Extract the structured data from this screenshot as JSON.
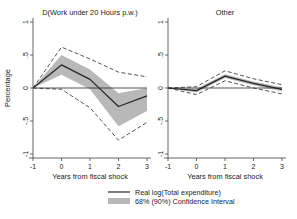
{
  "figure": {
    "background_color": "#ffffff",
    "band_color": "#b8b8b8",
    "line_color": "#262626",
    "axis_color": "#555555"
  },
  "legend": {
    "line_label": "Real log(Total expenditure)",
    "band_label": "68% (90%) Confidence Interval"
  },
  "chart_data": {
    "type": "line",
    "title": "",
    "xlabel": "Years from fiscal shock",
    "ylabel": "Percentage",
    "xlim": [
      -1,
      3
    ],
    "ylim": [
      -1,
      1
    ],
    "x": [
      -1,
      0,
      1,
      2,
      3
    ],
    "xticks": [
      "-1",
      "0",
      "1",
      "2",
      "3"
    ],
    "yticks": [
      "1",
      ".5",
      "0",
      "-.5",
      "-1"
    ],
    "ytickvals": [
      1,
      0.5,
      0,
      -0.5,
      -1
    ],
    "grid": false,
    "legend_position": "bottom-center",
    "panels": [
      {
        "title": "D(Work under 20 Hours p.w.)",
        "series": [
          {
            "name": "Real log(Total expenditure)",
            "values": [
              0,
              0.35,
              0.13,
              -0.28,
              -0.12
            ]
          },
          {
            "name": "68% CI upper",
            "values": [
              0,
              0.5,
              0.28,
              -0.08,
              0.0
            ]
          },
          {
            "name": "68% CI lower",
            "values": [
              0,
              0.2,
              -0.02,
              -0.58,
              -0.35
            ]
          },
          {
            "name": "90% CI upper",
            "values": [
              0,
              0.62,
              0.44,
              0.24,
              0.17
            ]
          },
          {
            "name": "90% CI lower",
            "values": [
              0,
              -0.02,
              -0.3,
              -0.79,
              -0.52
            ]
          }
        ]
      },
      {
        "title": "Other",
        "series": [
          {
            "name": "Real log(Total expenditure)",
            "values": [
              0,
              -0.04,
              0.18,
              0.07,
              -0.02
            ]
          },
          {
            "name": "68% CI upper",
            "values": [
              0,
              -0.01,
              0.21,
              0.1,
              0.01
            ]
          },
          {
            "name": "68% CI lower",
            "values": [
              0,
              -0.07,
              0.15,
              0.04,
              -0.05
            ]
          },
          {
            "name": "90% CI upper",
            "values": [
              0,
              0.02,
              0.26,
              0.14,
              0.05
            ]
          },
          {
            "name": "90% CI lower",
            "values": [
              0,
              -0.1,
              0.11,
              0.0,
              -0.09
            ]
          }
        ]
      }
    ]
  }
}
